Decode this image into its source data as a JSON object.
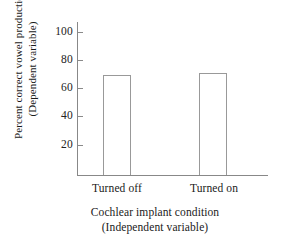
{
  "chart_data": {
    "type": "bar",
    "title": "",
    "categories": [
      "Turned off",
      "Turned on"
    ],
    "values": [
      69,
      71
    ],
    "series": [
      {
        "name": "Percent correct vowel production",
        "values": [
          69,
          71
        ]
      }
    ],
    "xlabel": "Cochlear implant condition",
    "xlabel_sub": "(Independent variable)",
    "ylabel": "Percent correct vowel production",
    "ylabel_sub": "(Dependent variable)",
    "ylim": [
      0,
      105
    ],
    "yticks": [
      20,
      40,
      60,
      80,
      100
    ],
    "ytick_labels": [
      "20",
      "40",
      "60",
      "80",
      "100"
    ],
    "grid": false,
    "legend": "none",
    "bar_style": {
      "fill": "#ffffff",
      "edge": "#999999"
    },
    "axis_color": "#888888",
    "background": "#ffffff"
  },
  "axes": {
    "y_tick_labels": [
      "100",
      "80",
      "60",
      "40",
      "20"
    ],
    "y_title_line1": "Percent correct vowel production",
    "y_title_line2": "(Dependent variable)",
    "x_title_line1": "Cochlear implant condition",
    "x_title_line2": "(Independent variable)",
    "x_tick_labels": [
      "Turned off",
      "Turned on"
    ]
  }
}
